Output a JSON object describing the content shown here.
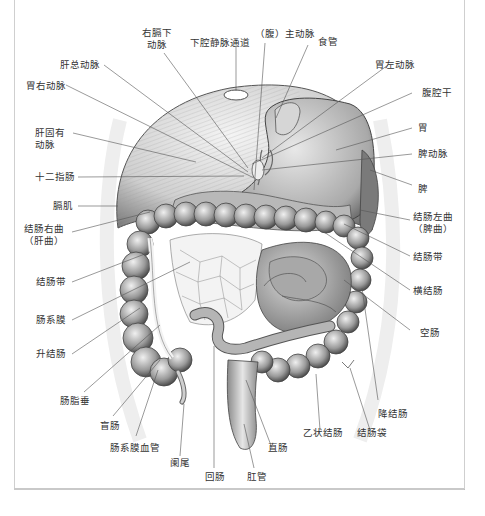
{
  "diagram": {
    "title": "",
    "labels_left": [
      {
        "id": "hepatic-common-artery",
        "text": "肝总动脉"
      },
      {
        "id": "right-gastric-artery",
        "text": "胃右动脉"
      },
      {
        "id": "proper-hepatic-artery",
        "line1": "肝固有",
        "line2": "动脉"
      },
      {
        "id": "duodenum",
        "text": "十二指肠"
      },
      {
        "id": "diaphragm",
        "text": "膈肌"
      },
      {
        "id": "right-colic-flexure",
        "line1": "结肠右曲",
        "line2": "（肝曲）"
      },
      {
        "id": "taenia-coli-left",
        "text": "结肠带"
      },
      {
        "id": "mesentery",
        "text": "肠系膜"
      },
      {
        "id": "ascending-colon",
        "text": "升结肠"
      },
      {
        "id": "epiploic-appendices",
        "text": "肠脂垂"
      }
    ],
    "labels_top": [
      {
        "id": "right-inferior-phrenic-artery",
        "line1": "右膈下",
        "line2": "动脉"
      },
      {
        "id": "ivc-passage",
        "text": "下腔静脉通道"
      },
      {
        "id": "abdominal-aorta",
        "text": "（腹）主动脉"
      },
      {
        "id": "esophagus",
        "text": "食管"
      }
    ],
    "labels_right": [
      {
        "id": "left-gastric-artery",
        "text": "胃左动脉"
      },
      {
        "id": "celiac-trunk",
        "text": "腹腔干"
      },
      {
        "id": "stomach",
        "text": "胃"
      },
      {
        "id": "splenic-artery",
        "text": "脾动脉"
      },
      {
        "id": "spleen",
        "text": "脾"
      },
      {
        "id": "left-colic-flexure",
        "line1": "结肠左曲",
        "line2": "（脾曲）"
      },
      {
        "id": "taenia-coli-right",
        "text": "结肠带"
      },
      {
        "id": "transverse-colon",
        "text": "横结肠"
      },
      {
        "id": "jejunum",
        "text": "空肠"
      },
      {
        "id": "descending-colon",
        "text": "降结肠"
      }
    ],
    "labels_bottom": [
      {
        "id": "cecum",
        "text": "盲肠"
      },
      {
        "id": "mesenteric-vessels",
        "text": "肠系膜血管"
      },
      {
        "id": "appendix",
        "text": "阑尾"
      },
      {
        "id": "ileum",
        "text": "回肠"
      },
      {
        "id": "anal-canal",
        "text": "肛管"
      },
      {
        "id": "rectum",
        "text": "直肠"
      },
      {
        "id": "sigmoid-colon",
        "text": "乙状结肠"
      },
      {
        "id": "haustra",
        "text": "结肠袋"
      }
    ],
    "colors": {
      "line": "#555555",
      "text": "#333333",
      "frame": "#cfcfcf"
    }
  }
}
